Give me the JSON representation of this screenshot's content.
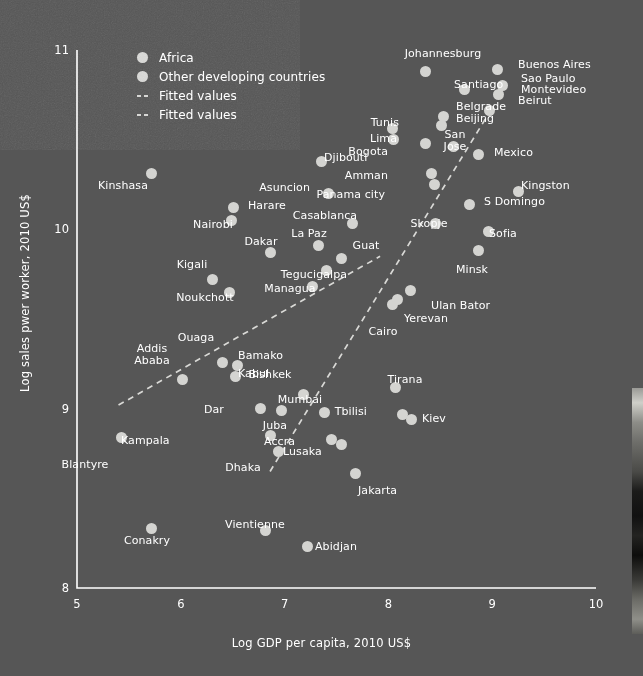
{
  "chart_data": {
    "type": "scatter",
    "title": "",
    "xlabel": "Log GDP per capita, 2010 US$",
    "ylabel": "Log sales pwer worker, 2010 US$",
    "xlim": [
      5,
      10
    ],
    "ylim": [
      8,
      11
    ],
    "xticks": [
      "5",
      "6",
      "7",
      "8",
      "9",
      "10"
    ],
    "yticks": [
      "8",
      "9",
      "10",
      "11"
    ],
    "grid": false,
    "legend_position": "top-left",
    "legend": [
      {
        "label": "Africa",
        "marker": "circle"
      },
      {
        "label": "Other developing countries",
        "marker": "circle"
      },
      {
        "label": "Fitted values",
        "marker": "dashed-line"
      },
      {
        "label": "Fitted values",
        "marker": "dashed-line"
      }
    ],
    "series": [
      {
        "name": "Africa",
        "points": [
          {
            "label": "Kinshasa",
            "x": 5.72,
            "y": 10.31,
            "lx": 123,
            "ly": 180,
            "align": "c"
          },
          {
            "label": "Harare",
            "x": 6.51,
            "y": 10.12,
            "lx": 248,
            "ly": 200,
            "align": "l"
          },
          {
            "label": "Nairobi",
            "x": 6.49,
            "y": 10.05,
            "lx": 213,
            "ly": 219,
            "align": "c"
          },
          {
            "label": "Dakar",
            "x": 6.86,
            "y": 9.87,
            "lx": 261,
            "ly": 236,
            "align": "c"
          },
          {
            "label": "Kigali",
            "x": 6.31,
            "y": 9.72,
            "lx": 192,
            "ly": 259,
            "align": "c"
          },
          {
            "label": "Noukchott",
            "x": 6.47,
            "y": 9.65,
            "lx": 205,
            "ly": 292,
            "align": "c"
          },
          {
            "label": "Ouaga",
            "x": 6.4,
            "y": 9.26,
            "lx": 196,
            "ly": 332,
            "align": "c"
          },
          {
            "label": "Addis Ababa",
            "x": 6.02,
            "y": 9.16,
            "lx": 152,
            "ly": 343,
            "align": "c"
          },
          {
            "label": "Bamako",
            "x": 6.55,
            "y": 9.24,
            "lx": 238,
            "ly": 350,
            "align": "l"
          },
          {
            "label": "Kabul",
            "x": 6.53,
            "y": 9.18,
            "lx": 238,
            "ly": 368,
            "align": "l"
          },
          {
            "label": "Dar",
            "x": 6.77,
            "y": 9.0,
            "lx": 224,
            "ly": 404,
            "align": "r"
          },
          {
            "label": "Juba",
            "x": 6.97,
            "y": 8.99,
            "lx": 275,
            "ly": 420,
            "align": "c"
          },
          {
            "label": "Kampala",
            "x": 6.86,
            "y": 8.85,
            "lx": 121,
            "ly": 435,
            "align": "l"
          },
          {
            "label": "Accra",
            "x": 7.45,
            "y": 8.83,
            "lx": 264,
            "ly": 436,
            "align": "l"
          },
          {
            "label": "Lusaka",
            "x": 7.55,
            "y": 8.8,
            "lx": 283,
            "ly": 446,
            "align": "l"
          },
          {
            "label": "Dhaka",
            "x": 6.94,
            "y": 8.76,
            "lx": 243,
            "ly": 462,
            "align": "c"
          },
          {
            "label": "Blantyre",
            "x": 5.43,
            "y": 8.84,
            "lx": 85,
            "ly": 459,
            "align": "c"
          },
          {
            "label": "Conakry",
            "x": 5.72,
            "y": 8.33,
            "lx": 147,
            "ly": 535,
            "align": "c"
          },
          {
            "label": "Abidjan",
            "x": 7.22,
            "y": 8.23,
            "lx": 315,
            "ly": 541,
            "align": "l"
          },
          {
            "label": "Johannesburg",
            "x": 8.36,
            "y": 10.88,
            "lx": 443,
            "ly": 48,
            "align": "c"
          },
          {
            "label": "Tunis",
            "x": 8.04,
            "y": 10.56,
            "lx": 399,
            "ly": 117,
            "align": "r"
          },
          {
            "label": "Lima",
            "x": 8.05,
            "y": 10.5,
            "lx": 397,
            "ly": 133,
            "align": "r"
          },
          {
            "label": "Casablanca",
            "x": 7.65,
            "y": 10.03,
            "lx": 325,
            "ly": 210,
            "align": "c"
          },
          {
            "label": "Cairo",
            "x": 8.04,
            "y": 9.58,
            "lx": 383,
            "ly": 326,
            "align": "c"
          }
        ]
      },
      {
        "name": "Other developing countries",
        "points": [
          {
            "label": "Buenos Aires",
            "x": 9.05,
            "y": 10.89,
            "lx": 518,
            "ly": 59,
            "align": "l"
          },
          {
            "label": "Sao Paulo",
            "x": 9.1,
            "y": 10.8,
            "lx": 521,
            "ly": 73,
            "align": "l"
          },
          {
            "label": "Montevideo",
            "x": 9.06,
            "y": 10.75,
            "lx": 521,
            "ly": 84,
            "align": "l"
          },
          {
            "label": "Beirut",
            "x": 8.97,
            "y": 10.66,
            "lx": 518,
            "ly": 95,
            "align": "l"
          },
          {
            "label": "Santiago",
            "x": 8.73,
            "y": 10.78,
            "lx": 454,
            "ly": 79,
            "align": "l"
          },
          {
            "label": "Belgrade",
            "x": 8.53,
            "y": 10.63,
            "lx": 456,
            "ly": 101,
            "align": "l"
          },
          {
            "label": "Beijing",
            "x": 8.51,
            "y": 10.58,
            "lx": 456,
            "ly": 113,
            "align": "l"
          },
          {
            "label": "San Jose",
            "x": 8.63,
            "y": 10.46,
            "lx": 455,
            "ly": 129,
            "align": "c"
          },
          {
            "label": "Bogota",
            "x": 8.36,
            "y": 10.48,
            "lx": 388,
            "ly": 146,
            "align": "r"
          },
          {
            "label": "Mexico",
            "x": 8.87,
            "y": 10.42,
            "lx": 494,
            "ly": 147,
            "align": "l"
          },
          {
            "label": "Amman",
            "x": 8.42,
            "y": 10.31,
            "lx": 388,
            "ly": 170,
            "align": "r"
          },
          {
            "label": "Panama city",
            "x": 8.44,
            "y": 10.25,
            "lx": 385,
            "ly": 189,
            "align": "r"
          },
          {
            "label": "Djibouti",
            "x": 7.36,
            "y": 10.38,
            "lx": 324,
            "ly": 152,
            "align": "l"
          },
          {
            "label": "Asuncion",
            "x": 7.42,
            "y": 10.2,
            "lx": 310,
            "ly": 182,
            "align": "r"
          },
          {
            "label": "Kingston",
            "x": 9.25,
            "y": 10.21,
            "lx": 521,
            "ly": 180,
            "align": "l"
          },
          {
            "label": "S Domingo",
            "x": 8.78,
            "y": 10.14,
            "lx": 484,
            "ly": 196,
            "align": "l"
          },
          {
            "label": "Skopje",
            "x": 8.45,
            "y": 10.03,
            "lx": 429,
            "ly": 218,
            "align": "c"
          },
          {
            "label": "Sofia",
            "x": 8.96,
            "y": 9.99,
            "lx": 489,
            "ly": 228,
            "align": "l"
          },
          {
            "label": "La Paz",
            "x": 7.33,
            "y": 9.91,
            "lx": 309,
            "ly": 228,
            "align": "c"
          },
          {
            "label": "Guat",
            "x": 7.55,
            "y": 9.84,
            "lx": 366,
            "ly": 240,
            "align": "c"
          },
          {
            "label": "Minsk",
            "x": 8.87,
            "y": 9.88,
            "lx": 472,
            "ly": 264,
            "align": "c"
          },
          {
            "label": "Tegucigalpa",
            "x": 7.4,
            "y": 9.77,
            "lx": 314,
            "ly": 269,
            "align": "c"
          },
          {
            "label": "Managua",
            "x": 7.27,
            "y": 9.68,
            "lx": 290,
            "ly": 283,
            "align": "c"
          },
          {
            "label": "Ulan Bator",
            "x": 8.21,
            "y": 9.66,
            "lx": 431,
            "ly": 300,
            "align": "l"
          },
          {
            "label": "Yerevan",
            "x": 8.09,
            "y": 9.61,
            "lx": 404,
            "ly": 313,
            "align": "l"
          },
          {
            "label": "Bishkek",
            "x": 7.18,
            "y": 9.08,
            "lx": 270,
            "ly": 369,
            "align": "c"
          },
          {
            "label": "Mumbai",
            "x": 7.38,
            "y": 8.98,
            "lx": 300,
            "ly": 394,
            "align": "c"
          },
          {
            "label": "Tirana",
            "x": 8.07,
            "y": 9.12,
            "lx": 405,
            "ly": 374,
            "align": "c"
          },
          {
            "label": "Tbilisi",
            "x": 8.14,
            "y": 8.97,
            "lx": 367,
            "ly": 406,
            "align": "r"
          },
          {
            "label": "Kiev",
            "x": 8.22,
            "y": 8.94,
            "lx": 422,
            "ly": 413,
            "align": "l"
          },
          {
            "label": "Jakarta",
            "x": 7.68,
            "y": 8.64,
            "lx": 358,
            "ly": 485,
            "align": "l"
          },
          {
            "label": "Vientienne",
            "x": 6.82,
            "y": 8.32,
            "lx": 255,
            "ly": 519,
            "align": "c"
          }
        ]
      }
    ],
    "fitted_lines": [
      {
        "name": "Fitted values (Africa)",
        "style": "dashed",
        "x0": 5.4,
        "y0": 9.02,
        "x1": 7.92,
        "y1": 9.85
      },
      {
        "name": "Fitted values (Other developing countries)",
        "style": "dashed",
        "x0": 6.86,
        "y0": 8.65,
        "x1": 8.96,
        "y1": 10.64
      }
    ]
  }
}
